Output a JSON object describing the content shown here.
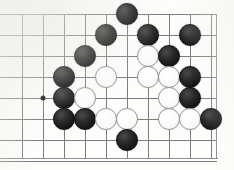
{
  "board": {
    "kind": "go-board-diagram",
    "description": "Go (Weiqi/Baduk) board position fragment, scanned book diagram",
    "grid": {
      "columns": 10,
      "rows": 8,
      "spacing_px": 21,
      "origin_x_px": 22,
      "origin_y_px": 14,
      "line_color": "#7d7d7d",
      "edge_color": "#8a8a8a",
      "background_color": "#fdfdfc",
      "bottom_edge_y_px": 158,
      "right_edge_x_px": 216
    },
    "markers": [
      {
        "name": "hoshi",
        "label": "star point",
        "col": 2,
        "row": 5,
        "color": "#1b1b1b"
      }
    ],
    "stone_colors": {
      "black": "#161616",
      "white": "#fbfbfa",
      "white_outline": "#9a9a9a"
    },
    "stone_radius_px": 11,
    "stones": [
      {
        "color": "black",
        "col": 6,
        "row": 1
      },
      {
        "color": "black",
        "col": 5,
        "row": 2
      },
      {
        "color": "black",
        "col": 7,
        "row": 2
      },
      {
        "color": "black",
        "col": 9,
        "row": 2
      },
      {
        "color": "black",
        "col": 4,
        "row": 3
      },
      {
        "color": "white",
        "col": 7,
        "row": 3
      },
      {
        "color": "black",
        "col": 8,
        "row": 3
      },
      {
        "color": "black",
        "col": 3,
        "row": 4
      },
      {
        "color": "white",
        "col": 5,
        "row": 4
      },
      {
        "color": "white",
        "col": 7,
        "row": 4
      },
      {
        "color": "white",
        "col": 8,
        "row": 4
      },
      {
        "color": "black",
        "col": 9,
        "row": 4
      },
      {
        "color": "black",
        "col": 3,
        "row": 5
      },
      {
        "color": "white",
        "col": 4,
        "row": 5
      },
      {
        "color": "white",
        "col": 8,
        "row": 5
      },
      {
        "color": "black",
        "col": 9,
        "row": 5
      },
      {
        "color": "black",
        "col": 3,
        "row": 6
      },
      {
        "color": "black",
        "col": 4,
        "row": 6
      },
      {
        "color": "white",
        "col": 5,
        "row": 6
      },
      {
        "color": "white",
        "col": 6,
        "row": 6
      },
      {
        "color": "white",
        "col": 8,
        "row": 6
      },
      {
        "color": "white",
        "col": 9,
        "row": 6
      },
      {
        "color": "black",
        "col": 10,
        "row": 6
      },
      {
        "color": "black",
        "col": 6,
        "row": 7
      }
    ],
    "counts": {
      "black_stones": 14,
      "white_stones": 10,
      "total_stones": 24
    }
  }
}
